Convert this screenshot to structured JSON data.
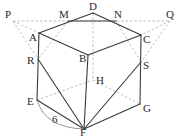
{
  "diagram": {
    "type": "cube-with-section",
    "labels": {
      "P": "P",
      "M": "M",
      "D": "D",
      "N": "N",
      "Q": "Q",
      "A": "A",
      "B": "B",
      "C": "C",
      "R": "R",
      "S": "S",
      "H": "H",
      "E": "E",
      "G": "G",
      "F": "F"
    },
    "edge_length_label": "6",
    "colors": {
      "solid": "#3a3a3a",
      "hidden": "#b8b8b8",
      "text": "#2a2a2a"
    }
  }
}
